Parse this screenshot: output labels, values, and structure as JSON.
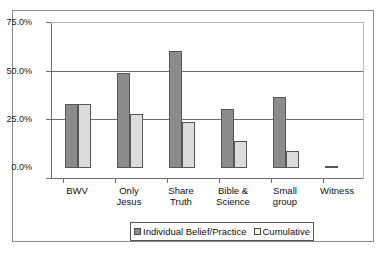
{
  "chart_data": {
    "type": "bar",
    "title": "",
    "xlabel": "",
    "ylabel": "",
    "ylim": [
      0,
      75
    ],
    "grid": true,
    "legend_position": "bottom",
    "categories": [
      "BWV",
      "Only Jesus",
      "Share Truth",
      "Bible & Science",
      "Small group",
      "Witness"
    ],
    "category_lines": [
      [
        "BWV"
      ],
      [
        "Only",
        "Jesus"
      ],
      [
        "Share",
        "Truth"
      ],
      [
        "Bible &",
        "Science"
      ],
      [
        "Small",
        "group"
      ],
      [
        "Witness"
      ]
    ],
    "ytick_labels": [
      "75.0%",
      "50.0%",
      "25.0%",
      "0.0%"
    ],
    "ytick_values": [
      75,
      50,
      25,
      0
    ],
    "series": [
      {
        "name": "Individual Belief/Practice",
        "color": "#8c8c8c",
        "values": [
          33.0,
          48.8,
          60.0,
          30.5,
          36.5,
          1.0
        ]
      },
      {
        "name": "Cumulative",
        "color": "#dcdcdc",
        "values": [
          33.0,
          27.7,
          23.8,
          13.8,
          8.5,
          0.0
        ]
      }
    ]
  },
  "legend": {
    "items": [
      {
        "label": "Individual Belief/Practice",
        "swatch": "series-a"
      },
      {
        "label": "Cumulative",
        "swatch": "series-b"
      }
    ]
  }
}
